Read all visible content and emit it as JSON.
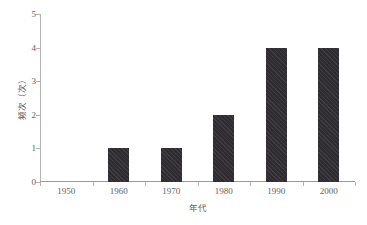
{
  "chart_data": {
    "type": "bar",
    "title": "",
    "subtitle": "",
    "xlabel": "年代",
    "ylabel": "频次（次）",
    "categories": [
      "1950",
      "1960",
      "1970",
      "1980",
      "1990",
      "2000"
    ],
    "values": [
      0,
      1,
      1,
      2,
      4,
      4
    ],
    "series": [
      {
        "name": "频次",
        "values": [
          0,
          1,
          1,
          2,
          4,
          4
        ]
      }
    ],
    "ylim": [
      0,
      5
    ],
    "y_ticks": [
      "0",
      "1",
      "2",
      "3",
      "4",
      "5"
    ],
    "y_tick_values": [
      0,
      1,
      2,
      3,
      4,
      5
    ],
    "x_ticks": [
      "1950",
      "1960",
      "1970",
      "1980",
      "1990",
      "2000"
    ],
    "grid": false,
    "legend": false,
    "legend_position": "none",
    "bar_color": "#333135",
    "axis_color": "#b4b4b4",
    "text_color": "#5f5f5f",
    "background_color": "#ffffff"
  }
}
